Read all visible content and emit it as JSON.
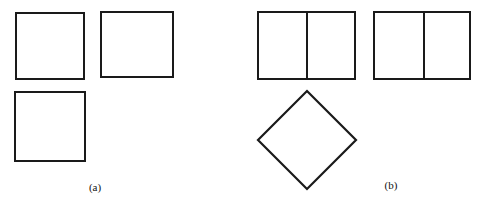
{
  "figure": {
    "width": 481,
    "height": 207,
    "background_color": "#ffffff",
    "stroke_color": "#1a1a1a",
    "thick_stroke_width": 2.2,
    "thin_stroke_width": 1.5
  },
  "panels": [
    {
      "id": "a",
      "label": "(a)",
      "label_x": 94,
      "label_y": 188,
      "shapes": [
        {
          "name": "square-top-left",
          "type": "square",
          "x": 16,
          "y": 13,
          "width": 68,
          "height": 66,
          "dividers": []
        },
        {
          "name": "square-top-right",
          "type": "square",
          "x": 101,
          "y": 12,
          "width": 72,
          "height": 65,
          "dividers": []
        },
        {
          "name": "square-bottom-left",
          "type": "square",
          "x": 15,
          "y": 92,
          "width": 70,
          "height": 69,
          "dividers": []
        }
      ]
    },
    {
      "id": "b",
      "label": "(b)",
      "label_x": 391,
      "label_y": 186,
      "shapes": [
        {
          "name": "divided-rectangle-left",
          "type": "rectangle",
          "x": 258,
          "y": 12,
          "width": 97,
          "height": 67,
          "dividers": [
            307
          ]
        },
        {
          "name": "divided-rectangle-right",
          "type": "rectangle",
          "x": 374,
          "y": 12,
          "width": 96,
          "height": 67,
          "dividers": [
            424
          ]
        },
        {
          "name": "diamond",
          "type": "diamond",
          "center_x": 307,
          "center_y": 140,
          "radius_x": 49,
          "radius_y": 49,
          "dividers": []
        }
      ]
    }
  ]
}
